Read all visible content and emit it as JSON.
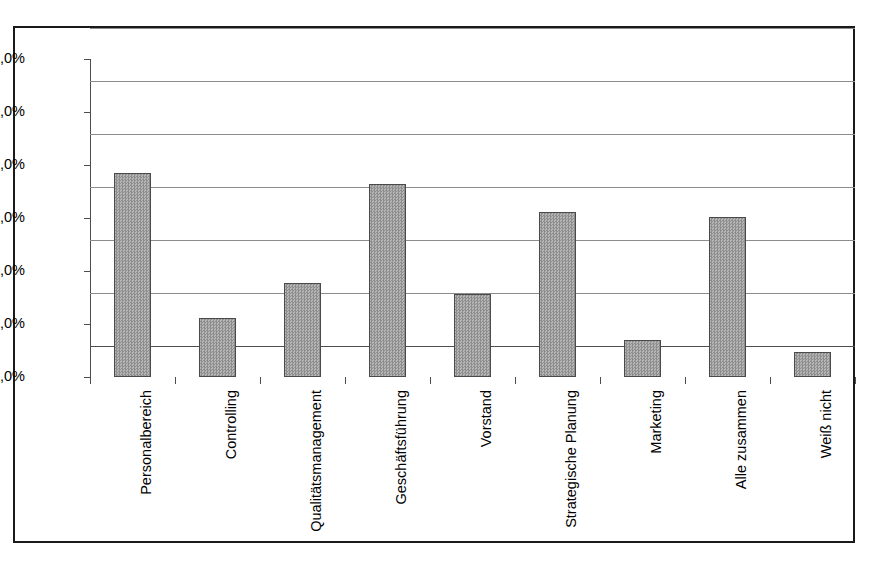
{
  "chart_data": {
    "type": "bar",
    "title": "",
    "subtitle": "",
    "xlabel": "",
    "ylabel": "",
    "ylim": [
      0,
      60
    ],
    "ytick_step": 10,
    "ytick_labels": [
      "0,0%",
      "10,0%",
      "20,0%",
      "30,0%",
      "40,0%",
      "50,0%",
      "60,0%"
    ],
    "ytick_values": [
      0,
      10,
      20,
      30,
      40,
      50,
      60
    ],
    "grid": true,
    "legend": "none",
    "value_suffix": "%",
    "categories": [
      "Personalbereich",
      "Controlling",
      "Qualitätsmanagement",
      "Geschäftsführung",
      "Vorstand",
      "Strategische Planung",
      "Marketing",
      "Alle zusammen",
      "Weiß nicht"
    ],
    "values": [
      38.5,
      11.1,
      17.8,
      36.5,
      15.7,
      31.1,
      7.0,
      30.2,
      4.8
    ],
    "bar_color": "#a0a0a0",
    "bar_border_color": "#4a4a4a",
    "grid_color": "#8c8c8c",
    "axis_color": "#4d4d4d",
    "frame_color": "#1a1a1a",
    "background_color": "#ffffff"
  }
}
